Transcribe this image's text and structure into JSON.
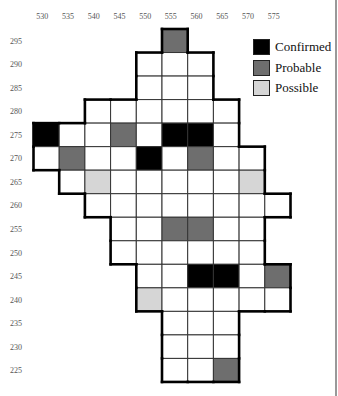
{
  "chart_data": {
    "type": "heatmap",
    "title": "",
    "xlabel": "",
    "ylabel": "",
    "x_ticks": [
      530,
      535,
      540,
      545,
      550,
      555,
      560,
      565,
      570,
      575
    ],
    "y_ticks": [
      295,
      290,
      285,
      280,
      275,
      270,
      265,
      260,
      255,
      250,
      245,
      240,
      235,
      230,
      225
    ],
    "columns": [
      530,
      535,
      540,
      545,
      550,
      555,
      560,
      565,
      570,
      575
    ],
    "legend": [
      {
        "key": "confirmed",
        "label": "Confirmed",
        "color": "#000000"
      },
      {
        "key": "probable",
        "label": "Probable",
        "color": "#6e6e6e"
      },
      {
        "key": "possible",
        "label": "Possible",
        "color": "#d6d6d6"
      }
    ],
    "grid_on": true,
    "legend_position": "upper right",
    "rows": [
      {
        "y": 295,
        "start": 555,
        "end": 555,
        "marked": {
          "555": "probable"
        }
      },
      {
        "y": 290,
        "start": 550,
        "end": 560,
        "marked": {}
      },
      {
        "y": 285,
        "start": 550,
        "end": 560,
        "marked": {}
      },
      {
        "y": 280,
        "start": 540,
        "end": 565,
        "marked": {}
      },
      {
        "y": 275,
        "start": 530,
        "end": 565,
        "marked": {
          "530": "confirmed",
          "545": "probable",
          "555": "confirmed",
          "560": "confirmed"
        }
      },
      {
        "y": 270,
        "start": 530,
        "end": 570,
        "marked": {
          "535": "probable",
          "550": "confirmed",
          "560": "probable"
        }
      },
      {
        "y": 265,
        "start": 535,
        "end": 570,
        "marked": {
          "540": "possible",
          "570": "possible"
        }
      },
      {
        "y": 260,
        "start": 540,
        "end": 575,
        "marked": {}
      },
      {
        "y": 255,
        "start": 545,
        "end": 570,
        "marked": {
          "555": "probable",
          "560": "probable"
        }
      },
      {
        "y": 250,
        "start": 545,
        "end": 570,
        "marked": {}
      },
      {
        "y": 245,
        "start": 550,
        "end": 575,
        "marked": {
          "560": "confirmed",
          "565": "confirmed",
          "575": "probable"
        }
      },
      {
        "y": 240,
        "start": 550,
        "end": 575,
        "marked": {
          "550": "possible"
        }
      },
      {
        "y": 235,
        "start": 555,
        "end": 565,
        "marked": {}
      },
      {
        "y": 230,
        "start": 555,
        "end": 565,
        "marked": {}
      },
      {
        "y": 225,
        "start": 555,
        "end": 565,
        "marked": {
          "565": "probable"
        }
      }
    ]
  },
  "legend_labels": {
    "confirmed": "Confirmed",
    "probable": "Probable",
    "possible": "Possible"
  }
}
